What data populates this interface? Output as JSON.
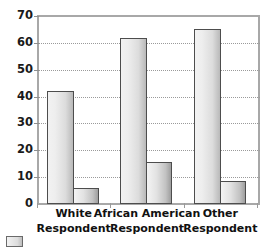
{
  "chart_data": {
    "type": "bar",
    "title": "",
    "xlabel": "",
    "ylabel": "",
    "ylim": [
      0,
      70
    ],
    "yticks": [
      0,
      10,
      20,
      30,
      40,
      50,
      60,
      70
    ],
    "grid": true,
    "legend_position": "bottom-left",
    "categories": [
      "White Respondent",
      "African American Respondent",
      "Other Respondent"
    ],
    "category_lines": [
      [
        "White",
        "Respondent"
      ],
      [
        "African American",
        "Respondent"
      ],
      [
        "Other",
        "Respondent"
      ]
    ],
    "series": [
      {
        "name": "Series 1",
        "values": [
          42,
          62,
          65
        ]
      },
      {
        "name": "Series 2",
        "values": [
          6,
          15.5,
          8.5
        ]
      }
    ]
  },
  "style": {
    "bar_series_a_fill": "#eeeeee",
    "bar_series_b_fill": "#d8d8d8",
    "bar_border": "#4d4d4d",
    "axis_color": "#a8a8a8",
    "gridline_color": "#9a9a9a",
    "tick_label_color": "#1a1a1a",
    "background": "#ffffff"
  },
  "legend": {
    "swatch_label": ""
  }
}
